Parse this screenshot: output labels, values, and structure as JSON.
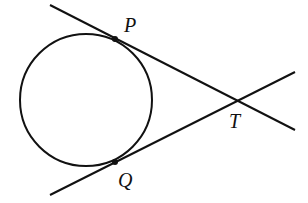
{
  "diagram": {
    "type": "circle with two tangent lines from external point",
    "labels": {
      "P": "P",
      "Q": "Q",
      "T": "T"
    },
    "circle": {
      "cx": 86,
      "cy": 100,
      "r": 66
    },
    "points": {
      "P": {
        "x": 115,
        "y": 39
      },
      "Q": {
        "x": 115,
        "y": 162
      },
      "T": {
        "x": 235,
        "y": 100
      }
    },
    "lines": [
      {
        "name": "tangent-PT",
        "x1": 50,
        "y1": 5,
        "x2": 295,
        "y2": 130
      },
      {
        "name": "tangent-QT",
        "x1": 50,
        "y1": 195,
        "x2": 295,
        "y2": 72
      }
    ],
    "stroke_color": "#111111"
  }
}
